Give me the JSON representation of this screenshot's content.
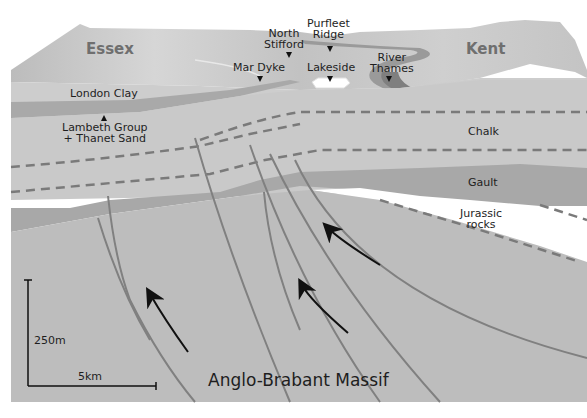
{
  "diagram": {
    "type": "geological cross-section",
    "regions": {
      "left": "Essex",
      "right": "Kent"
    },
    "place_markers": [
      {
        "label": "North\nStifford",
        "line1": "North",
        "line2": "Stifford"
      },
      {
        "label": "Purfleet\nRidge",
        "line1": "Purfleet",
        "line2": "Ridge"
      },
      {
        "label": "Mar Dyke",
        "line1": "Mar Dyke"
      },
      {
        "label": "Lakeside",
        "line1": "Lakeside"
      },
      {
        "label": "River\nThames",
        "line1": "River",
        "line2": "Thames"
      }
    ],
    "strata": [
      {
        "name": "London Clay"
      },
      {
        "name": "Lambeth Group + Thanet Sand",
        "line1": "Lambeth Group",
        "line2": "+ Thanet Sand"
      },
      {
        "name": "Chalk"
      },
      {
        "name": "Gault"
      },
      {
        "name": "Jurassic rocks",
        "line1": "Jurassic",
        "line2": "rocks"
      },
      {
        "name": "Anglo-Brabant Massif"
      }
    ],
    "scale_bar": {
      "vertical": "250m",
      "horizontal": "5km"
    },
    "colors": {
      "surface_light": "#d4d4d4",
      "surface_dark": "#b9b9b9",
      "london_clay": "#cdcdcd",
      "band_dark": "#a9a9a9",
      "chalk": "#c9c9c9",
      "gault": "#a8a8a8",
      "jurassic": "#ffffff",
      "massif": "#bdbdbd",
      "fault_line": "#808080",
      "dash_line": "#7a7a7a",
      "arrow": "#111111",
      "region_text": "#6f6f6f"
    }
  }
}
